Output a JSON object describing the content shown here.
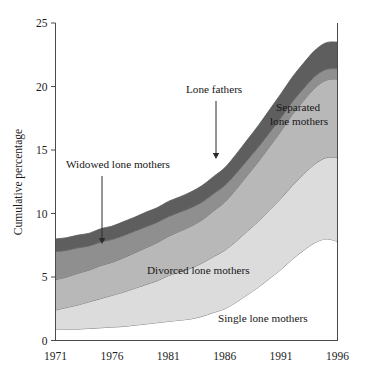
{
  "chart_data": {
    "type": "area",
    "stacked": true,
    "title": "",
    "subtitle": "",
    "xlabel": "",
    "ylabel": "Cumulative percentage",
    "xlim": [
      1971,
      1996
    ],
    "ylim": [
      0,
      25
    ],
    "grid": false,
    "legend_position": "inline-labels",
    "x_ticks": [
      "1971",
      "1976",
      "1981",
      "1986",
      "1991",
      "1996"
    ],
    "x_tick_values": [
      1971,
      1976,
      1981,
      1986,
      1991,
      1996
    ],
    "y_ticks": [
      "0",
      "5",
      "10",
      "15",
      "20",
      "25"
    ],
    "y_tick_values": [
      0,
      5,
      10,
      15,
      20,
      25
    ],
    "x": [
      1971,
      1972,
      1973,
      1974,
      1975,
      1976,
      1977,
      1978,
      1979,
      1980,
      1981,
      1982,
      1983,
      1984,
      1985,
      1986,
      1987,
      1988,
      1989,
      1990,
      1991,
      1992,
      1993,
      1994,
      1995,
      1996
    ],
    "series": [
      {
        "name": "Single lone mothers",
        "color": "#ffffff",
        "values": [
          0.9,
          0.9,
          0.9,
          0.95,
          1.0,
          1.05,
          1.1,
          1.2,
          1.3,
          1.4,
          1.5,
          1.6,
          1.7,
          1.9,
          2.2,
          2.5,
          3.0,
          3.6,
          4.2,
          4.9,
          5.6,
          6.4,
          7.1,
          7.7,
          8.0,
          7.8
        ]
      },
      {
        "name": "Divorced lone mothers",
        "color": "#dcdcdc",
        "values": [
          1.5,
          1.7,
          1.9,
          2.1,
          2.3,
          2.5,
          2.7,
          2.9,
          3.1,
          3.3,
          3.6,
          3.8,
          4.0,
          4.2,
          4.4,
          4.6,
          4.8,
          5.0,
          5.2,
          5.4,
          5.6,
          5.8,
          6.0,
          6.2,
          6.4,
          6.6
        ]
      },
      {
        "name": "Separated lone mothers",
        "color": "#b8b8b8",
        "values": [
          2.4,
          2.4,
          2.5,
          2.5,
          2.6,
          2.6,
          2.7,
          2.8,
          2.9,
          3.0,
          3.1,
          3.2,
          3.3,
          3.4,
          3.6,
          3.8,
          4.1,
          4.4,
          4.7,
          5.0,
          5.3,
          5.6,
          5.8,
          6.0,
          6.1,
          6.2
        ]
      },
      {
        "name": "Widowed lone mothers",
        "color": "#8f8f8f",
        "values": [
          2.2,
          2.1,
          2.0,
          1.9,
          1.85,
          1.8,
          1.75,
          1.7,
          1.65,
          1.6,
          1.55,
          1.5,
          1.45,
          1.4,
          1.35,
          1.3,
          1.25,
          1.2,
          1.15,
          1.1,
          1.05,
          1.0,
          0.95,
          0.9,
          0.85,
          0.8
        ]
      },
      {
        "name": "Lone fathers",
        "color": "#5e5e5e",
        "values": [
          1.0,
          1.0,
          1.0,
          1.0,
          1.05,
          1.05,
          1.1,
          1.1,
          1.15,
          1.15,
          1.2,
          1.2,
          1.25,
          1.3,
          1.35,
          1.4,
          1.5,
          1.6,
          1.7,
          1.8,
          1.9,
          1.95,
          2.0,
          2.05,
          2.1,
          2.1
        ]
      }
    ],
    "band_labels": [
      {
        "text": "Single lone mothers",
        "x_px": 218,
        "y_px": 322
      },
      {
        "text": "Divorced lone mothers",
        "x_px": 147,
        "y_px": 274
      },
      {
        "text": "Separated",
        "x_px": 276,
        "y_px": 111
      },
      {
        "text": "lone mothers",
        "x_px": 270,
        "y_px": 125
      }
    ],
    "annotations": [
      {
        "text": "Widowed lone mothers",
        "label_x_px": 66,
        "label_y_px": 168,
        "arrow_x_px": 102,
        "arrow_y_start_px": 176,
        "arrow_y_end_px": 244
      },
      {
        "text": "Lone fathers",
        "label_x_px": 186,
        "label_y_px": 93,
        "arrow_x_px": 216,
        "arrow_y_start_px": 101,
        "arrow_y_end_px": 159
      }
    ]
  },
  "axes": {
    "y_axis_title": "Cumulative percentage"
  }
}
